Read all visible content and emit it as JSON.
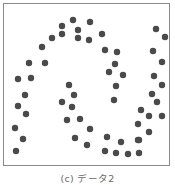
{
  "chart_data": {
    "type": "scatter",
    "title": "",
    "caption": "(c) データ2",
    "xlabel": "",
    "ylabel": "",
    "grid": false,
    "axes_visible": false,
    "legend": null,
    "marker_color": "#4a4a4a",
    "marker_radius": 3.2,
    "coordinate_system": "pixel (image space, origin top-left)",
    "series": [
      {
        "name": "points",
        "points": [
          [
            73,
            20
          ],
          [
            90,
            22
          ],
          [
            62,
            26
          ],
          [
            78,
            30
          ],
          [
            62,
            34
          ],
          [
            78,
            38
          ],
          [
            102,
            34
          ],
          [
            89,
            40
          ],
          [
            52,
            38
          ],
          [
            42,
            47
          ],
          [
            29,
            63
          ],
          [
            45,
            63
          ],
          [
            18,
            79
          ],
          [
            31,
            78
          ],
          [
            25,
            95
          ],
          [
            18,
            106
          ],
          [
            26,
            114
          ],
          [
            15,
            128
          ],
          [
            23,
            139
          ],
          [
            16,
            151
          ],
          [
            105,
            50
          ],
          [
            117,
            52
          ],
          [
            115,
            64
          ],
          [
            109,
            72
          ],
          [
            123,
            75
          ],
          [
            116,
            86
          ],
          [
            114,
            100
          ],
          [
            156,
            29
          ],
          [
            165,
            37
          ],
          [
            153,
            51
          ],
          [
            162,
            62
          ],
          [
            154,
            76
          ],
          [
            162,
            85
          ],
          [
            152,
            94
          ],
          [
            157,
            102
          ],
          [
            141,
            110
          ],
          [
            149,
            116
          ],
          [
            162,
            116
          ],
          [
            138,
            124
          ],
          [
            149,
            132
          ],
          [
            138,
            140
          ],
          [
            69,
            85
          ],
          [
            74,
            95
          ],
          [
            62,
            102
          ],
          [
            72,
            107
          ],
          [
            67,
            120
          ],
          [
            80,
            119
          ],
          [
            90,
            129
          ],
          [
            75,
            138
          ],
          [
            87,
            145
          ],
          [
            107,
            137
          ],
          [
            121,
            142
          ],
          [
            139,
            140
          ],
          [
            105,
            151
          ],
          [
            116,
            153
          ],
          [
            128,
            154
          ],
          [
            139,
            153
          ]
        ]
      }
    ]
  }
}
